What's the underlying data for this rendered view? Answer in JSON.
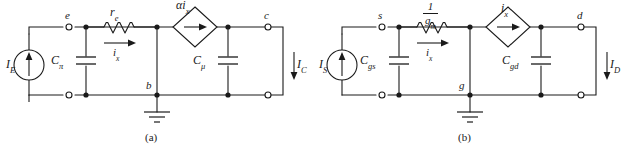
{
  "figure_a": {
    "caption": "(a)",
    "source_label": "I",
    "source_sub": "E",
    "cap_left_label": "C",
    "cap_left_sub": "π",
    "resistor_label": "r",
    "resistor_sub": "e",
    "branch_current_label": "i",
    "branch_current_sub": "x",
    "dep_source_label": "αi",
    "dep_source_sub": "x",
    "cap_right_label": "C",
    "cap_right_sub": "μ",
    "out_current_label": "I",
    "out_current_sub": "C",
    "node_left": "e",
    "node_right": "c",
    "node_bottom": "b"
  },
  "figure_b": {
    "caption": "(b)",
    "source_label": "I",
    "source_sub": "S",
    "cap_left_label": "C",
    "cap_left_sub": "gs",
    "resistor_numerator": "1",
    "resistor_denominator": "g",
    "resistor_denominator_sub": "m",
    "branch_current_label": "i",
    "branch_current_sub": "x",
    "dep_source_label": "i",
    "dep_source_sub": "x",
    "cap_right_label": "C",
    "cap_right_sub": "gd",
    "out_current_label": "I",
    "out_current_sub": "D",
    "node_left": "s",
    "node_right": "d",
    "node_bottom": "g"
  },
  "colors": {
    "wire": "#1a1a1a",
    "background": "#ffffff"
  }
}
